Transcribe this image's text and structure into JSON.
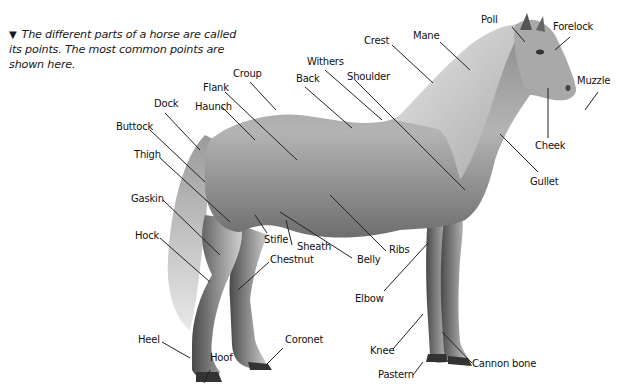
{
  "header": {
    "cut_off_title_fragment": ""
  },
  "caption": {
    "marker": "▼",
    "text": "The different parts of a horse are called its points. The most common points are shown here."
  },
  "colors": {
    "background": "#ffffff",
    "horse_body": "#9a9a9a",
    "horse_shadow": "#5a5a5a",
    "mane_tail": "#d8d8d8",
    "leader_line": "#222222",
    "label_text": "#111111"
  },
  "labels": {
    "poll": "Poll",
    "forelock": "Forelock",
    "mane": "Mane",
    "crest": "Crest",
    "withers": "Withers",
    "shoulder": "Shoulder",
    "back": "Back",
    "croup": "Croup",
    "flank": "Flank",
    "haunch": "Haunch",
    "dock": "Dock",
    "buttock": "Buttock",
    "thigh": "Thigh",
    "gaskin": "Gaskin",
    "hock": "Hock",
    "stifle": "Stifle",
    "sheath": "Sheath",
    "chestnut": "Chestnut",
    "belly": "Belly",
    "ribs": "Ribs",
    "elbow": "Elbow",
    "muzzle": "Muzzle",
    "cheek": "Cheek",
    "gullet": "Gullet",
    "heel": "Heel",
    "hoof": "Hoof",
    "coronet": "Coronet",
    "knee": "Knee",
    "pastern": "Pastern",
    "cannon_bone": "Cannon bone"
  }
}
